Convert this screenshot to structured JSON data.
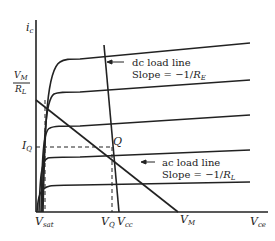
{
  "diagram": {
    "axes": {
      "y_label_main": "i",
      "y_label_sub": "c",
      "x_label_main": "V",
      "x_label_sub": "ce"
    },
    "y_ticks": {
      "vm_over_rl": {
        "num_main": "V",
        "num_sub": "M",
        "den_main": "R",
        "den_sub": "L"
      },
      "iq": {
        "main": "I",
        "sub": "Q"
      }
    },
    "x_ticks": {
      "vsat": {
        "main": "V",
        "sub": "sat"
      },
      "vq": {
        "main": "V",
        "sub": "Q"
      },
      "vcc": {
        "main": "V",
        "sub": "cc"
      },
      "vm": {
        "main": "V",
        "sub": "M"
      }
    },
    "point_q": "Q",
    "annotations": {
      "dc": {
        "line1": "dc load line",
        "line2_prefix": "Slope = −1/",
        "line2_var": "R",
        "line2_sub": "E"
      },
      "ac": {
        "line1": "ac load line",
        "line2_prefix": "Slope = −1/",
        "line2_var": "R",
        "line2_sub": "L"
      }
    },
    "colors": {
      "ink": "#222222",
      "background": "#ffffff"
    }
  }
}
